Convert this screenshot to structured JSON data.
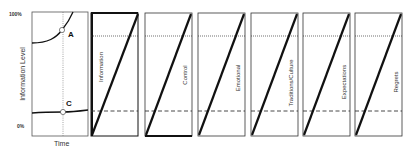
{
  "left_chart": {
    "y_axis_label": "Information Level",
    "x_axis_label": "Time",
    "y_ticks": [
      "100%",
      "0%"
    ],
    "points": [
      {
        "label": "A"
      },
      {
        "label": "C"
      }
    ]
  },
  "panels": [
    {
      "label": "Information"
    },
    {
      "label": "Control"
    },
    {
      "label": "Emotional"
    },
    {
      "label": "Traditions/Culture"
    },
    {
      "label": "Expectations"
    },
    {
      "label": "Regrets"
    }
  ]
}
